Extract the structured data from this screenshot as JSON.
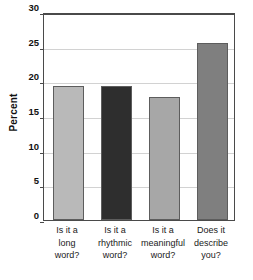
{
  "chart_data": {
    "type": "bar",
    "title": "",
    "xlabel": "",
    "ylabel": "Percent",
    "categories": [
      "Is it a long word?",
      "Is it a rhythmic word?",
      "Is it a meaningful word?",
      "Does it describe you?"
    ],
    "category_lines": [
      [
        "Is it a",
        "long",
        "word?"
      ],
      [
        "Is it a",
        "rhythmic",
        "word?"
      ],
      [
        "Is it a",
        "meaningful",
        "word?"
      ],
      [
        "Does it",
        "describe",
        "you?"
      ]
    ],
    "values": [
      19.4,
      19.4,
      17.8,
      25.5
    ],
    "ylim": [
      0,
      30
    ],
    "yticks": [
      0,
      5,
      10,
      15,
      20,
      25,
      30
    ],
    "ytick_labels": [
      "0",
      "5",
      "10",
      "15",
      "20",
      "25",
      "30"
    ],
    "grid": true,
    "legend": false,
    "bar_colors": [
      "#b9b9b9",
      "#2e2e2e",
      "#a7a7a7",
      "#7f7f7f"
    ],
    "bar_edge_color": "#5d5d5d",
    "axis_color": "#4a4a4a",
    "grid_color": "#d2d2d2",
    "background": "#ffffff"
  }
}
